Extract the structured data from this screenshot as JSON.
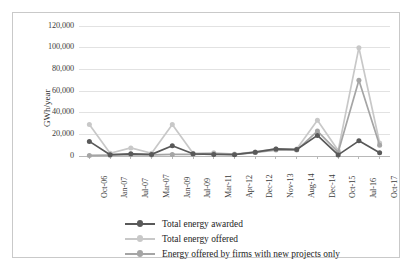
{
  "chart_data": {
    "type": "line",
    "title": "",
    "xlabel": "",
    "ylabel": "GWh/year",
    "ylim": [
      0,
      120000
    ],
    "ytick_labels": [
      "0",
      "20,000",
      "40,000",
      "60,000",
      "80,000",
      "100,000",
      "120,000"
    ],
    "ytick_values": [
      0,
      20000,
      40000,
      60000,
      80000,
      100000,
      120000
    ],
    "grid": true,
    "legend_position": "bottom",
    "categories": [
      "Oct-06",
      "Jan-07",
      "Jul-07",
      "Mar-07",
      "Jan-09",
      "Jul-09",
      "Mar-11",
      "Apr-12",
      "Dec-12",
      "Nov-13",
      "Aug-14",
      "Dec-14",
      "Oct-15",
      "Jul-16",
      "Oct-17"
    ],
    "series": [
      {
        "name": "Total energy awarded",
        "color": "#595959",
        "values": [
          13500,
          1200,
          2000,
          1500,
          9500,
          2000,
          1500,
          1200,
          3500,
          6500,
          6000,
          19000,
          1000,
          14000,
          3000
        ]
      },
      {
        "name": "Total energy offered",
        "color": "#c8c8c8",
        "values": [
          29000,
          2500,
          7500,
          2500,
          29000,
          2500,
          3000,
          1800,
          3800,
          6500,
          6500,
          33000,
          5000,
          100000,
          12000
        ]
      },
      {
        "name": "Energy offered by firms with new projects only",
        "color": "#a5a5a5",
        "values": [
          500,
          800,
          1200,
          1000,
          1500,
          1500,
          2000,
          1500,
          3200,
          5500,
          5500,
          23000,
          3500,
          70000,
          10000
        ]
      }
    ]
  },
  "legend": {
    "items": [
      {
        "label": "Total energy awarded"
      },
      {
        "label": "Total energy offered"
      },
      {
        "label": "Energy offered by firms with new projects only"
      }
    ]
  },
  "axes": {
    "y_title": "GWh/year"
  }
}
